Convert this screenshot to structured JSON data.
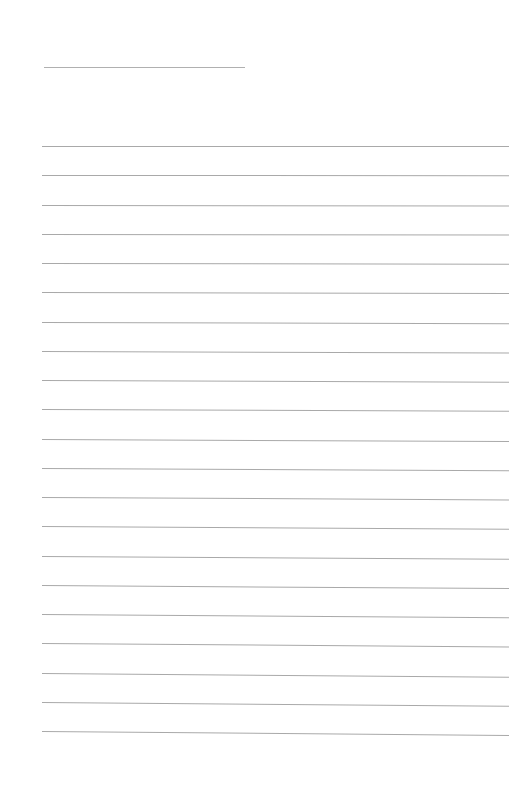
{
  "page": {
    "type": "lined-paper",
    "background_color": "#ffffff",
    "line_color": "#a9a9a9",
    "title_line": {
      "x_start": 44,
      "x_end": 245,
      "y": 67
    },
    "ruled_lines": {
      "count": 21,
      "x_start": 42,
      "x_end": 509,
      "first_y": 146,
      "spacing": 29.25
    }
  }
}
